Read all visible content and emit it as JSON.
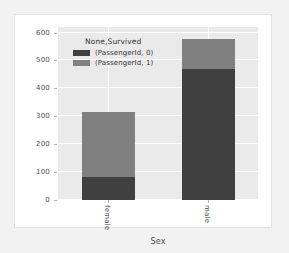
{
  "figure": {
    "background": "#ffffff",
    "page_background": "#f2f2f2",
    "plot_background": "#eaeaea"
  },
  "legend": {
    "title": "None,Survived",
    "entries": [
      {
        "label": "(PassengerId, 0)",
        "color": "#404040"
      },
      {
        "label": "(PassengerId, 1)",
        "color": "#808080"
      }
    ]
  },
  "axis": {
    "xlabel": "Sex",
    "ylabel": "",
    "yticks": [
      "600",
      "500",
      "400",
      "300",
      "200",
      "100",
      "0"
    ],
    "xticks": [
      "female",
      "male"
    ]
  },
  "chart_data": {
    "type": "bar",
    "title": "",
    "subtitle": "",
    "xlabel": "Sex",
    "ylabel": "",
    "stacked": true,
    "orientation": "vertical",
    "categories": [
      "female",
      "male"
    ],
    "series": [
      {
        "name": "(PassengerId, 0)",
        "color": "#404040",
        "values": [
          81,
          468
        ]
      },
      {
        "name": "(PassengerId, 1)",
        "color": "#808080",
        "values": [
          233,
          109
        ]
      }
    ],
    "totals": [
      314,
      577
    ],
    "ylim": [
      0,
      620
    ],
    "yticks": [
      0,
      100,
      200,
      300,
      400,
      500,
      600
    ],
    "grid": true,
    "grid_color": "#ffffff",
    "legend_title": "None,Survived",
    "legend_position": "upper-left-inside",
    "annotations": []
  }
}
